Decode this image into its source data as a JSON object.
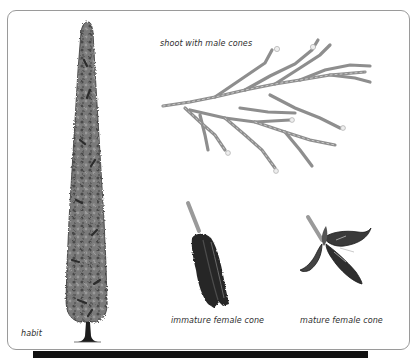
{
  "figure": {
    "labels": {
      "shoot": "shoot with male cones",
      "habit": "habit",
      "immature_cone": "immature female cone",
      "mature_cone": "mature female cone"
    },
    "colors": {
      "frame_border": "#9a9a9a",
      "foliage": "#6f6f6f",
      "foliage_dark": "#3a3a3a",
      "shoot": "#9c9c9c",
      "cone_dark": "#262626",
      "bottom_bar": "#111111"
    }
  }
}
